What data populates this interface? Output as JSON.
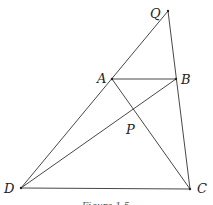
{
  "diagram": {
    "points": {
      "Q": {
        "label": "Q",
        "x": 168,
        "y": 11,
        "lx": 150,
        "ly": 18
      },
      "A": {
        "label": "A",
        "x": 112,
        "y": 79,
        "lx": 97,
        "ly": 83
      },
      "B": {
        "label": "B",
        "x": 176,
        "y": 79,
        "lx": 181,
        "ly": 84
      },
      "P": {
        "label": "P",
        "x": 132,
        "y": 109,
        "lx": 126,
        "ly": 134
      },
      "D": {
        "label": "D",
        "x": 21,
        "y": 188,
        "lx": 4,
        "ly": 193
      },
      "C": {
        "label": "C",
        "x": 190,
        "y": 189,
        "lx": 197,
        "ly": 193
      }
    },
    "segments": [
      [
        "D",
        "Q"
      ],
      [
        "Q",
        "C"
      ],
      [
        "A",
        "B"
      ],
      [
        "A",
        "C"
      ],
      [
        "D",
        "B"
      ],
      [
        "D",
        "C"
      ]
    ],
    "caption": "Figure 1.5"
  }
}
